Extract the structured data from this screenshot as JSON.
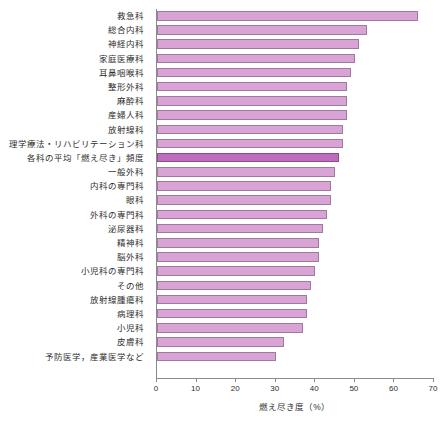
{
  "chart_data": {
    "type": "bar",
    "orientation": "horizontal",
    "title": "",
    "xlabel": "燃え尽き度（%）",
    "ylabel": "",
    "xlim": [
      0,
      70
    ],
    "xticks": [
      0,
      10,
      20,
      30,
      40,
      50,
      60,
      70
    ],
    "grid": false,
    "legend": false,
    "highlight_category": "各科の平均「燃え尽き」頻度",
    "colors": {
      "bar_fill": "#d9a3d6",
      "bar_edge": "#9d7b9e",
      "highlight_fill": "#c06cbe",
      "highlight_edge": "#8d4d8c",
      "axis": "#8a8a8a",
      "text": "#2e2e2e",
      "background": "#ffffff"
    },
    "categories": [
      "救急科",
      "総合内科",
      "神経内科",
      "家庭医療科",
      "耳鼻咽喉科",
      "整形外科",
      "麻酔科",
      "産婦人科",
      "放射線科",
      "理学療法・リハビリテーション科",
      "各科の平均「燃え尽き」頻度",
      "一般外科",
      "内科の専門科",
      "眼科",
      "外科の専門科",
      "泌尿器科",
      "精神科",
      "脳外科",
      "小児科の専門科",
      "その他",
      "放射線腫瘍科",
      "病理科",
      "小児科",
      "皮膚科",
      "予防医学，産業医学など"
    ],
    "values": [
      66,
      53,
      51,
      50,
      49,
      48,
      48,
      48,
      47,
      47,
      46,
      45,
      44,
      44,
      43,
      42,
      41,
      41,
      40,
      39,
      38,
      38,
      37,
      32,
      30
    ]
  }
}
